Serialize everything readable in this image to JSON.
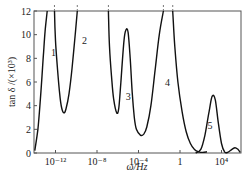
{
  "chart_data": {
    "type": "line",
    "title": "",
    "xlabel": "ω/Hz",
    "ylabel": "tan δ /(×10³)",
    "xscale": "log",
    "x_ticks": [
      {
        "value": -12,
        "label": "10⁻¹²"
      },
      {
        "value": -8,
        "label": "10⁻⁸"
      },
      {
        "value": -4,
        "label": "10⁻⁴"
      },
      {
        "value": 0,
        "label": "1"
      },
      {
        "value": 4,
        "label": "10⁴"
      }
    ],
    "y_ticks": [
      0,
      2,
      4,
      6,
      8,
      10,
      12
    ],
    "xlim_log10": [
      -14,
      5.8
    ],
    "ylim": [
      0,
      12
    ],
    "grid": false,
    "legend": "none (curves labeled inline 1–5)",
    "series": [
      {
        "name": "1",
        "label_pos_log10": -12.2,
        "label_value": 8.5,
        "log10_omega": [
          -14.0,
          -13.7,
          -13.5,
          -13.3,
          -13.15,
          -13.0,
          -12.8
        ],
        "values": [
          0.2,
          2.0,
          4.0,
          6.5,
          8.5,
          10.3,
          12.0
        ]
      },
      {
        "name": "2",
        "label_pos_log10": -9.2,
        "label_value": 9.5,
        "log10_omega": [
          -12.1,
          -12.0,
          -11.8,
          -11.6,
          -11.4,
          -11.2,
          -11.0,
          -10.7,
          -10.4,
          -10.1,
          -9.9
        ],
        "values": [
          12.0,
          9.5,
          7.0,
          5.0,
          3.8,
          3.4,
          3.7,
          5.0,
          7.2,
          10.0,
          12.0
        ],
        "dashed_above": 12
      },
      {
        "name": "3",
        "label_pos_log10": -5.0,
        "label_value": 4.8,
        "log10_omega": [
          -6.9,
          -6.8,
          -6.6,
          -6.4,
          -6.1,
          -5.9,
          -5.7,
          -5.4,
          -5.2,
          -5.0,
          -4.8,
          -4.6,
          -4.4,
          -4.2,
          -3.8,
          -3.5,
          -3.2,
          -2.8,
          -2.4,
          -2.0,
          -1.6
        ],
        "values": [
          12.0,
          9.0,
          6.5,
          4.6,
          3.4,
          3.8,
          6.0,
          9.5,
          10.4,
          10.2,
          8.0,
          5.0,
          3.0,
          2.0,
          1.5,
          1.6,
          2.2,
          4.0,
          7.0,
          10.0,
          12.0
        ],
        "dashed_above": 12
      },
      {
        "name": "4",
        "label_pos_log10": -1.2,
        "label_value": 6.0,
        "log10_omega": [
          -0.7,
          -0.5,
          -0.2,
          0.2,
          0.6,
          1.0,
          1.4,
          1.8,
          2.2,
          2.6
        ],
        "values": [
          12.0,
          9.0,
          6.0,
          3.5,
          1.8,
          0.8,
          0.3,
          0.1,
          0.05,
          0.1
        ],
        "dashed_above": 12
      },
      {
        "name": "5",
        "label_pos_log10": 2.9,
        "label_value": 2.3,
        "log10_omega": [
          1.5,
          2.0,
          2.4,
          2.8,
          3.1,
          3.4,
          3.7,
          4.0,
          4.3,
          4.6,
          5.0,
          5.3,
          5.6,
          5.8
        ],
        "values": [
          0.0,
          0.3,
          1.5,
          3.5,
          4.8,
          4.5,
          2.5,
          0.8,
          0.1,
          0.05,
          0.3,
          0.45,
          0.3,
          0.05
        ]
      }
    ]
  },
  "labels": {
    "y_axis_title": "tan δ /(×10³)",
    "x_axis_title": "ω/Hz",
    "curve_1": "1",
    "curve_2": "2",
    "curve_3": "3",
    "curve_4": "4",
    "curve_5": "5"
  }
}
